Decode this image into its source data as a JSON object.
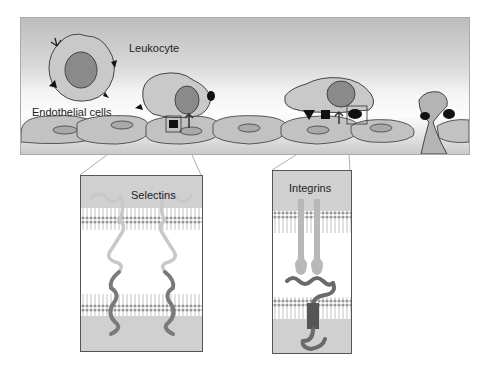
{
  "top_panel": {
    "labels": {
      "leukocyte": "Leukocyte",
      "endothelial": "Endothelial cells"
    }
  },
  "inset_selectins": {
    "title": "Selectins"
  },
  "inset_integrins": {
    "title": "Integrins"
  },
  "colors": {
    "cell_fill": "#bfbfbf",
    "nucleus": "#8a8a8a",
    "outline": "#444444",
    "membrane": "#9a9a9a",
    "protein_light": "#c8c8c8",
    "protein_dark": "#7a7a7a"
  }
}
